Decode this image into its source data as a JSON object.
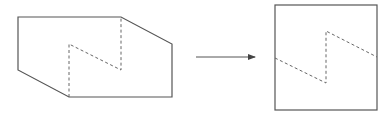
{
  "diagram": {
    "stroke_color": "#555555",
    "left_figure": {
      "outline": [
        [
          18,
          17
        ],
        [
          121,
          17
        ],
        [
          172,
          44
        ],
        [
          172,
          97
        ],
        [
          69,
          97
        ],
        [
          18,
          70
        ]
      ],
      "dashed": [
        [
          69,
          97
        ],
        [
          69,
          44
        ],
        [
          121,
          70
        ],
        [
          121,
          17
        ]
      ]
    },
    "arrow": {
      "from": [
        196,
        57
      ],
      "to": [
        255,
        57
      ]
    },
    "right_figure": {
      "rect": {
        "x": 275,
        "y": 5,
        "w": 102,
        "h": 105
      },
      "dashed": [
        [
          275,
          58
        ],
        [
          326,
          83
        ],
        [
          326,
          31
        ],
        [
          377,
          57
        ]
      ]
    }
  }
}
